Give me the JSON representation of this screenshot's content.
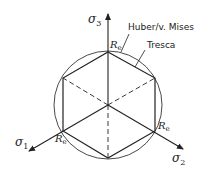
{
  "diagram": {
    "axes": [
      {
        "id": "sigma3",
        "symbol": "σ",
        "subscript": "3"
      },
      {
        "id": "sigma1",
        "symbol": "σ",
        "subscript": "1"
      },
      {
        "id": "sigma2",
        "symbol": "σ",
        "subscript": "2"
      }
    ],
    "yield_labels": [
      {
        "id": "re-top",
        "symbol": "R",
        "subscript": "e"
      },
      {
        "id": "re-left",
        "symbol": "R",
        "subscript": "e"
      },
      {
        "id": "re-right",
        "symbol": "R",
        "subscript": "e"
      }
    ],
    "criteria": {
      "mises_label": "Huber/v. Mises",
      "tresca_label": "Tresca"
    },
    "colors": {
      "line": "#222222",
      "background": "#ffffff"
    }
  }
}
